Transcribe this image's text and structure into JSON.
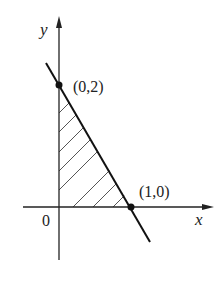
{
  "diagram": {
    "type": "coordinate-plot",
    "axes": {
      "x_label": "x",
      "y_label": "y",
      "origin_label": "0"
    },
    "line": {
      "description": "line through (0,2) and (1,0)",
      "equation": "2x + y = 2"
    },
    "points": [
      {
        "label": "(0,2)",
        "x": 0,
        "y": 2
      },
      {
        "label": "(1,0)",
        "x": 1,
        "y": 0
      }
    ],
    "shaded_region": {
      "description": "triangle bounded by axes and line",
      "vertices": [
        [
          0,
          0
        ],
        [
          0,
          2
        ],
        [
          1,
          0
        ]
      ],
      "fill": "hatched"
    },
    "colors": {
      "stroke": "#222222",
      "hatch": "#555555",
      "background": "#ffffff"
    }
  }
}
